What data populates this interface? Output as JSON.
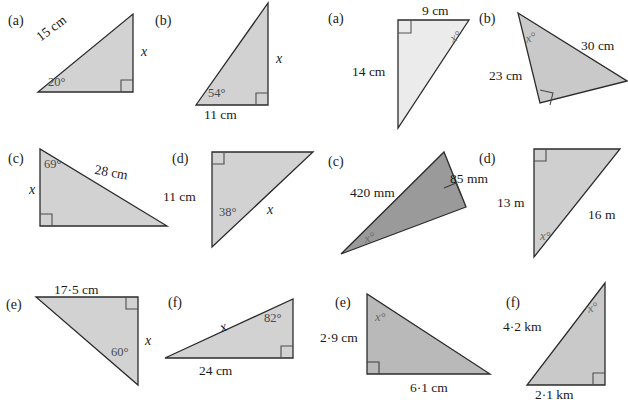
{
  "page": {
    "background": "#ffffff",
    "fill_light": "#d2d2d2",
    "fill_pale": "#e8e8e8",
    "fill_dark": "#9a9a9a",
    "stroke": "#2b2b2b"
  },
  "left_group": {
    "items": [
      {
        "key": "a",
        "part_label": "(a)",
        "labels": {
          "hypotenuse": "15 cm",
          "vertical": "x",
          "angle": "20°"
        }
      },
      {
        "key": "b",
        "part_label": "(b)",
        "labels": {
          "vertical": "x",
          "angle": "54°",
          "base": "11 cm"
        }
      },
      {
        "key": "c",
        "part_label": "(c)",
        "labels": {
          "angle": "69°",
          "hypotenuse": "28 cm",
          "vertical": "x"
        }
      },
      {
        "key": "d",
        "part_label": "(d)",
        "labels": {
          "vertical": "11 cm",
          "angle": "38°",
          "hypotenuse": "x"
        }
      },
      {
        "key": "e",
        "part_label": "(e)",
        "labels": {
          "top": "17·5 cm",
          "vertical": "x",
          "angle": "60°"
        }
      },
      {
        "key": "f",
        "part_label": "(f)",
        "labels": {
          "hypotenuse": "x",
          "angle": "82°",
          "base": "24 cm"
        }
      }
    ]
  },
  "right_group": {
    "items": [
      {
        "key": "a",
        "part_label": "(a)",
        "labels": {
          "top": "9 cm",
          "vertical": "14 cm",
          "unknown_angle": "x°"
        }
      },
      {
        "key": "b",
        "part_label": "(b)",
        "labels": {
          "unknown_angle": "x°",
          "side_right": "30 cm",
          "side_left": "23 cm"
        }
      },
      {
        "key": "c",
        "part_label": "(c)",
        "labels": {
          "long_side": "420 mm",
          "short_side": "85 mm",
          "unknown_angle": "x°"
        }
      },
      {
        "key": "d",
        "part_label": "(d)",
        "labels": {
          "vertical": "13 m",
          "hypotenuse": "16 m",
          "unknown_angle": "x°"
        }
      },
      {
        "key": "e",
        "part_label": "(e)",
        "labels": {
          "unknown_angle": "x°",
          "vertical": "2·9 cm",
          "base": "6·1 cm"
        }
      },
      {
        "key": "f",
        "part_label": "(f)",
        "labels": {
          "unknown_angle": "x°",
          "hypotenuse": "4·2 km",
          "base": "2·1 km"
        }
      }
    ]
  }
}
